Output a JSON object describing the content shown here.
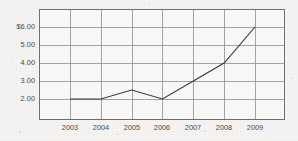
{
  "chart_data": {
    "type": "line",
    "title": "",
    "subtitle": "",
    "xlabel": "",
    "ylabel": "",
    "categories": [
      "2003",
      "2004",
      "2005",
      "2006",
      "2007",
      "2008",
      "2009"
    ],
    "x": [
      2003,
      2004,
      2005,
      2006,
      2007,
      2008,
      2009
    ],
    "values": [
      2.0,
      2.0,
      2.5,
      2.0,
      3.0,
      4.0,
      6.0
    ],
    "series": [
      {
        "name": "",
        "values": [
          2.0,
          2.0,
          2.5,
          2.0,
          3.0,
          4.0,
          6.0
        ]
      }
    ],
    "ytick_labels": [
      "$6.00",
      "5.00",
      "4.00",
      "3.00",
      "2.00"
    ],
    "ytick_values": [
      6.0,
      5.0,
      4.0,
      3.0,
      2.0
    ],
    "xtick_labels": [
      "2003",
      "2004",
      "2005",
      "2006",
      "2007",
      "2008",
      "2009"
    ],
    "ylim": [
      1.0,
      6.5
    ],
    "xlim": [
      2002.5,
      2009.5
    ],
    "grid": true,
    "legend": "none",
    "line_color": "#3a3a3a",
    "grid_color": "#8d8d8d",
    "frame_color": "#6e6e6e",
    "background_color": "#f5f4f2",
    "annotations": []
  },
  "yticks": [
    {
      "label": "$6.00",
      "value": 6.0
    },
    {
      "label": "5.00",
      "value": 5.0
    },
    {
      "label": "4.00",
      "value": 4.0
    },
    {
      "label": "3.00",
      "value": 3.0
    },
    {
      "label": "2.00",
      "value": 2.0
    }
  ],
  "xticks": [
    {
      "label": "2003",
      "value": 2003
    },
    {
      "label": "2004",
      "value": 2004
    },
    {
      "label": "2005",
      "value": 2005
    },
    {
      "label": "2006",
      "value": 2006
    },
    {
      "label": "2007",
      "value": 2007
    },
    {
      "label": "2008",
      "value": 2008
    },
    {
      "label": "2009",
      "value": 2009
    }
  ]
}
